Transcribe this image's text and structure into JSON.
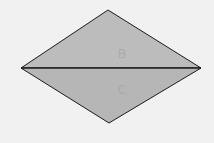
{
  "diagram": {
    "type": "rhombus-split-by-diagonal",
    "fill": "#b9b9b9",
    "stroke": "#1a1a1a",
    "background": "#f1f1f1",
    "vertices": {
      "top": [
        108,
        10
      ],
      "right": [
        201,
        68
      ],
      "bottom": [
        109,
        123
      ],
      "left": [
        21,
        68
      ]
    },
    "labels": {
      "upper": "B",
      "lower": "C"
    }
  }
}
